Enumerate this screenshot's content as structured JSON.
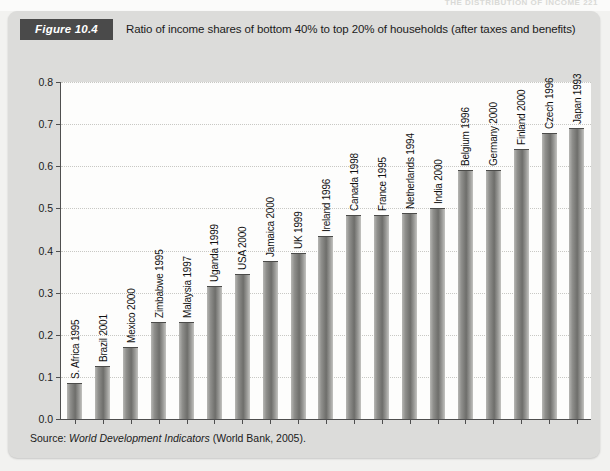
{
  "page": {
    "running_head": "THE DISTRIBUTION OF INCOME   221"
  },
  "figure": {
    "tag": "Figure 10.4",
    "caption": "Ratio of income shares of bottom 40% to top 20% of households (after taxes and benefits)",
    "source_prefix": "Source: ",
    "source_italic": "World Development Indicators",
    "source_suffix": " (World Bank, 2005)."
  },
  "chart_data": {
    "type": "bar",
    "title": "Ratio of income shares of bottom 40% to top 20% of households (after taxes and benefits)",
    "xlabel": "",
    "ylabel": "",
    "ylim": [
      0.0,
      0.8
    ],
    "ytick_labels": [
      "0.0",
      "0.1",
      "0.2",
      "0.3",
      "0.4",
      "0.5",
      "0.6",
      "0.7",
      "0.8"
    ],
    "ytick_values": [
      0.0,
      0.1,
      0.2,
      0.3,
      0.4,
      0.5,
      0.6,
      0.7,
      0.8
    ],
    "grid": true,
    "legend": "none",
    "categories": [
      "S. Africa 1995",
      "Brazil 2001",
      "Mexico 2000",
      "Zimbabwe 1995",
      "Malaysia 1997",
      "Uganda 1999",
      "USA 2000",
      "Jamaica 2000",
      "UK 1999",
      "Ireland 1996",
      "Canada 1998",
      "France 1995",
      "Netherlands 1994",
      "India 2000",
      "Belgium 1996",
      "Germany 2000",
      "Finland 2000",
      "Czech 1996",
      "Japan 1993"
    ],
    "values": [
      0.085,
      0.125,
      0.17,
      0.23,
      0.23,
      0.315,
      0.345,
      0.375,
      0.395,
      0.435,
      0.485,
      0.485,
      0.49,
      0.5,
      0.59,
      0.59,
      0.64,
      0.68,
      0.69
    ]
  },
  "colors": {
    "panel_background": "#dcdcda",
    "plot_background": "#fdfdfc",
    "tag_background": "#4a4a4a",
    "tag_text": "#ffffff",
    "bar_fill": "#8f8f8c",
    "axis": "#4f4f4f",
    "gridline": "#c8c8c4",
    "text": "#1b1b1b"
  }
}
